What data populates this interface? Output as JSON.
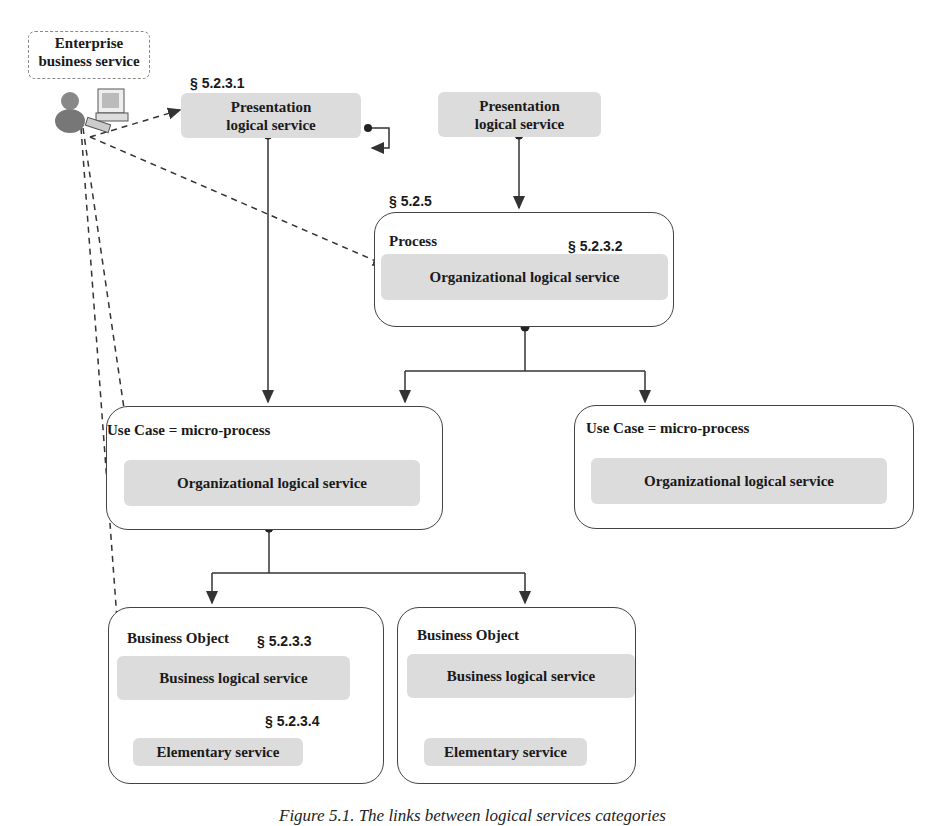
{
  "actor": {
    "label": "Enterprise business service",
    "label_line1": "Enterprise",
    "label_line2": "business service",
    "icon": "user-with-computer-icon"
  },
  "sections": {
    "presentation": "§ 5.2.3.1",
    "process": "§ 5.2.5",
    "organizational": "§ 5.2.3.2",
    "business": "§ 5.2.3.3",
    "elementary": "§ 5.2.3.4"
  },
  "presentation_left": {
    "line1": "Presentation",
    "line2": "logical service"
  },
  "presentation_right": {
    "line1": "Presentation",
    "line2": "logical service"
  },
  "process": {
    "label": "Process",
    "service": "Organizational logical service"
  },
  "use_case_left": {
    "label": "Use Case = micro-process",
    "service": "Organizational logical service"
  },
  "use_case_right": {
    "label": "Use Case = micro-process",
    "service": "Organizational logical service"
  },
  "business_object_left": {
    "label": "Business Object",
    "service": "Business logical service",
    "elementary": "Elementary service"
  },
  "business_object_right": {
    "label": "Business Object",
    "service": "Business logical service",
    "elementary": "Elementary service"
  },
  "caption": "Figure 5.1. The links between logical services categories",
  "colors": {
    "service_fill": "#dcdcdc",
    "border": "#444444",
    "line": "#333333"
  }
}
